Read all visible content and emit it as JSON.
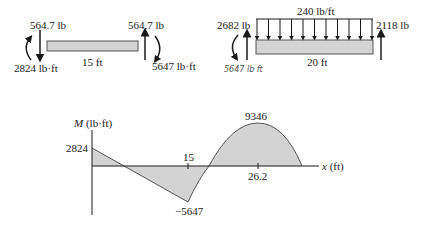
{
  "left_beam": {
    "left_force_label": "564.7 lb",
    "left_moment_label": "2824 lb·ft",
    "length_label": "15 ft",
    "right_force_label": "564.7 lb",
    "right_moment_label": "5647 lb·ft"
  },
  "right_beam": {
    "distributed_load_label": "240 lb/ft",
    "left_force_label": "2682 lb",
    "left_moment_handwritten": "5647 lb ft",
    "length_label": "20 ft",
    "right_force_label": "2118 lb"
  },
  "moment_diagram": {
    "y_axis_label_var": "M",
    "y_axis_label_unit": " (lb·ft)",
    "x_axis_label_var": "x",
    "x_axis_label_unit": " (ft)",
    "value_start": "2824",
    "tick_15": "15",
    "value_min": "−5647",
    "value_max": "9346",
    "tick_max_x": "26.2"
  },
  "colors": {
    "beam_fill": "#d4d4d4",
    "area_fill": "#d3d3d3",
    "line": "#1a1a1a"
  }
}
